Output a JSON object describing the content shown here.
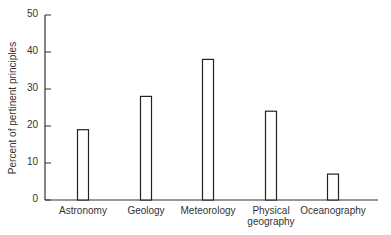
{
  "chart_data": {
    "type": "bar",
    "title": "",
    "xlabel": "",
    "ylabel": "Percent of pertinent principles",
    "ylim": [
      0,
      50
    ],
    "yticks": [
      0,
      10,
      20,
      30,
      40,
      50
    ],
    "grid": false,
    "legend": null,
    "categories": [
      "Astronomy",
      "Geology",
      "Meteorology",
      "Physical geography",
      "Oceanography"
    ],
    "category_lines": [
      [
        "Astronomy"
      ],
      [
        "Geology"
      ],
      [
        "Meteorology"
      ],
      [
        "Physical",
        "geography"
      ],
      [
        "Oceanography"
      ]
    ],
    "values": [
      19,
      28,
      38,
      24,
      7
    ],
    "bar_style": "outlined",
    "colors": {
      "bar_fill": "#ffffff",
      "bar_stroke": "#222222",
      "axis": "#333333"
    }
  }
}
